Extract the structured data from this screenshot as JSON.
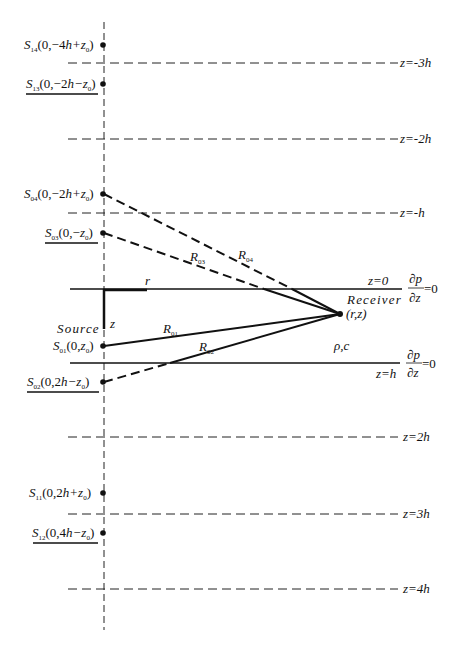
{
  "figure": {
    "medium_label": "ρ,c",
    "axes": {
      "r_label": "r",
      "z_label": "z"
    },
    "receiver": {
      "label": "Receiver",
      "coords": "(r,z)"
    },
    "source_label": "Source",
    "boundaries": [
      {
        "id": "top",
        "label": "z=0",
        "condition_num": "∂p",
        "condition_den": "∂z",
        "condition_rhs": "=0"
      },
      {
        "id": "bottom",
        "label": "z=h",
        "condition_num": "∂p",
        "condition_den": "∂z",
        "condition_rhs": "=0"
      }
    ],
    "image_planes": [
      {
        "label": "z=-3h"
      },
      {
        "label": "z=-2h"
      },
      {
        "label": "z=-h"
      },
      {
        "label": "z=2h"
      },
      {
        "label": "z=3h"
      },
      {
        "label": "z=4h"
      }
    ],
    "sources": [
      {
        "name": "S",
        "sub": "14",
        "coords_pre": "(0,−4",
        "h": "h",
        "coords_post": "+z",
        "z_sub": "0",
        "close": ")",
        "underlined": false
      },
      {
        "name": "S",
        "sub": "13",
        "coords_pre": "(0,−2",
        "h": "h",
        "coords_post": "−z",
        "z_sub": "0",
        "close": ")",
        "underlined": true
      },
      {
        "name": "S",
        "sub": "04",
        "coords_pre": "(0,−2",
        "h": "h",
        "coords_post": "+z",
        "z_sub": "0",
        "close": ")",
        "underlined": false
      },
      {
        "name": "S",
        "sub": "03",
        "coords_pre": "(0,−",
        "h": "",
        "coords_post": "z",
        "z_sub": "0",
        "close": ")",
        "underlined": true
      },
      {
        "name": "S",
        "sub": "01",
        "coords_pre": "(0,",
        "h": "",
        "coords_post": "z",
        "z_sub": "0",
        "close": ")",
        "underlined": false
      },
      {
        "name": "S",
        "sub": "02",
        "coords_pre": "(0,2",
        "h": "h",
        "coords_post": "−z",
        "z_sub": "0",
        "close": ")",
        "underlined": true
      },
      {
        "name": "S",
        "sub": "11",
        "coords_pre": "(0,2",
        "h": "h",
        "coords_post": "+z",
        "z_sub": "0",
        "close": ")",
        "underlined": false
      },
      {
        "name": "S",
        "sub": "12",
        "coords_pre": "(0,4",
        "h": "h",
        "coords_post": "−z",
        "z_sub": "0",
        "close": ")",
        "underlined": true
      }
    ],
    "rays": [
      {
        "name": "R",
        "sub": "01",
        "style": "solid"
      },
      {
        "name": "R",
        "sub": "02",
        "style": "solid+dashed"
      },
      {
        "name": "R",
        "sub": "03",
        "style": "solid+dashed"
      },
      {
        "name": "R",
        "sub": "04",
        "style": "solid+dashed"
      }
    ]
  }
}
